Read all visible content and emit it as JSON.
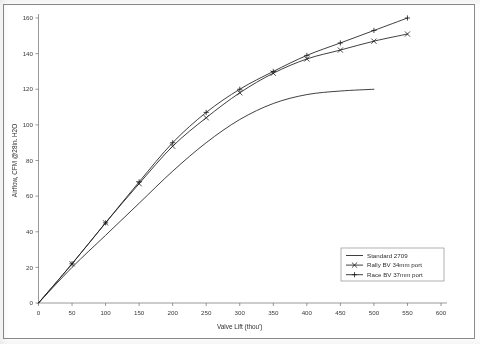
{
  "chart_data": {
    "type": "line",
    "title": "",
    "xlabel": "Valve Lift (thou')",
    "ylabel": "Airflow, CFM @28in. H2O",
    "xlim": [
      0,
      600
    ],
    "ylim": [
      0,
      160
    ],
    "xticks": [
      0,
      50,
      100,
      150,
      200,
      250,
      300,
      350,
      400,
      450,
      500,
      550,
      600
    ],
    "yticks": [
      0,
      20,
      40,
      60,
      80,
      100,
      120,
      140,
      160
    ],
    "grid": false,
    "legend_position": "lower-right-inside",
    "x": [
      0,
      50,
      100,
      150,
      200,
      250,
      300,
      350,
      400,
      450,
      500,
      550
    ],
    "series": [
      {
        "name": "Standard 2709",
        "marker": "none",
        "x": [
          0,
          50,
          100,
          150,
          200,
          250,
          300,
          350,
          400,
          450,
          500
        ],
        "values": [
          0,
          20,
          38,
          56,
          74,
          90,
          103,
          112,
          117,
          119,
          120
        ]
      },
      {
        "name": "Rally BV 34mm port",
        "marker": "x",
        "x": [
          0,
          50,
          100,
          150,
          200,
          250,
          300,
          350,
          400,
          450,
          500,
          550
        ],
        "values": [
          0,
          22,
          45,
          67,
          88,
          104,
          118,
          129,
          137,
          142,
          147,
          151
        ]
      },
      {
        "name": "Race BV 37mm port",
        "marker": "plus",
        "x": [
          0,
          50,
          100,
          150,
          200,
          250,
          300,
          350,
          400,
          450,
          500,
          550
        ],
        "values": [
          0,
          22,
          45,
          68,
          90,
          107,
          120,
          130,
          139,
          146,
          153,
          160
        ]
      }
    ]
  },
  "legend": {
    "entries": [
      {
        "label": "Standard 2709",
        "marker": "none"
      },
      {
        "label": "Rally BV 34mm port",
        "marker": "x"
      },
      {
        "label": "Race BV 37mm port",
        "marker": "plus"
      }
    ]
  },
  "axis": {
    "x_title": "Valve Lift (thou')",
    "y_title": "Airflow, CFM @28in. H2O",
    "x_tick_labels": [
      "0",
      "50",
      "100",
      "150",
      "200",
      "250",
      "300",
      "350",
      "400",
      "450",
      "500",
      "550",
      "600"
    ],
    "y_tick_labels": [
      "0",
      "20",
      "40",
      "60",
      "80",
      "100",
      "120",
      "140",
      "160"
    ]
  },
  "colors": {
    "line": "#1d1d1d",
    "axis": "#6f6f6f",
    "text": "#2e2e2e",
    "background": "#ffffff",
    "frame": "#8a8a8a"
  }
}
